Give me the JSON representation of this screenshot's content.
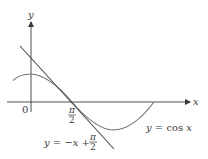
{
  "figure": {
    "axes": {
      "x_label": "x",
      "y_label": "y",
      "origin_label": "0"
    },
    "ticks": {
      "pi_over_2": {
        "numerator": "π",
        "denominator": "2"
      }
    },
    "curves": {
      "cosine": {
        "label": "y = cos x"
      },
      "tangent": {
        "label_prefix": "y = −x +",
        "label_frac_num": "π",
        "label_frac_den": "2"
      }
    },
    "colors": {
      "axis": "#3a3a3a",
      "curve": "#707070",
      "tangent": "#4a4a4a"
    }
  }
}
